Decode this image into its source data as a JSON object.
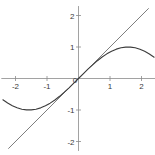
{
  "chart_data": {
    "type": "line",
    "title": "",
    "subtitle": "",
    "xlabel": "",
    "ylabel": "",
    "xlim": [
      -2.45,
      2.45
    ],
    "ylim": [
      -2.3,
      2.3
    ],
    "grid": false,
    "legend": "none",
    "background": "#ffffff",
    "axis_color": "#8a8a8a",
    "xticks": [
      -2,
      -1,
      0,
      1,
      2
    ],
    "yticks": [
      -2,
      -1,
      0,
      1,
      2
    ],
    "xticklabels": [
      "-2",
      "-1",
      "0",
      "1",
      "2"
    ],
    "yticklabels": [
      "-2",
      "-1",
      "0",
      "1",
      "2"
    ],
    "series": [
      {
        "name": "y = x",
        "color": "#6f6f6f",
        "width": 0.9,
        "x": [
          -2.22,
          2.22
        ],
        "values": [
          -2.22,
          2.22
        ]
      },
      {
        "name": "y = sin(x)",
        "color": "#3c3c3c",
        "width": 1.1,
        "x": [
          -2.4,
          -2.25,
          -2.1,
          -1.95,
          -1.8,
          -1.65,
          -1.5,
          -1.35,
          -1.2,
          -1.05,
          -0.9,
          -0.75,
          -0.6,
          -0.45,
          -0.3,
          -0.15,
          0.0,
          0.15,
          0.3,
          0.45,
          0.6,
          0.75,
          0.9,
          1.05,
          1.2,
          1.35,
          1.5,
          1.65,
          1.8,
          1.95,
          2.1,
          2.25,
          2.4
        ],
        "values": [
          -0.675,
          -0.778,
          -0.863,
          -0.929,
          -0.974,
          -0.997,
          -0.997,
          -0.976,
          -0.932,
          -0.867,
          -0.783,
          -0.682,
          -0.565,
          -0.435,
          -0.296,
          -0.149,
          0.0,
          0.149,
          0.296,
          0.435,
          0.565,
          0.682,
          0.783,
          0.867,
          0.932,
          0.976,
          0.997,
          0.997,
          0.974,
          0.929,
          0.863,
          0.778,
          0.675
        ]
      }
    ]
  },
  "labels": {
    "x_neg2": "-2",
    "x_neg1": "-1",
    "x_zero": "0",
    "x_pos1": "1",
    "x_pos2": "2",
    "y_neg2": "-2",
    "y_neg1": "-1",
    "y_pos1": "1",
    "y_pos2": "2"
  }
}
